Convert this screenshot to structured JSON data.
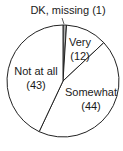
{
  "chart_data": {
    "type": "pie",
    "title": "",
    "categories": [
      "DK, missing",
      "Very",
      "Somewhat",
      "Not at all"
    ],
    "values": [
      1,
      12,
      44,
      43
    ],
    "start_angle": "12 o'clock",
    "direction": "clockwise",
    "colors": [
      "#b0b0b0",
      "#ffffff",
      "#ffffff",
      "#ffffff"
    ],
    "labels": [
      {
        "name": "DK, missing (1)",
        "line1": "DK, missing (1)",
        "line2": ""
      },
      {
        "name": "Very",
        "line1": "Very",
        "line2": "(12)"
      },
      {
        "name": "Somewhat",
        "line1": "Somewhat",
        "line2": "(44)"
      },
      {
        "name": "Not at all",
        "line1": "Not at all",
        "line2": "(43)"
      }
    ],
    "legend": "none"
  }
}
